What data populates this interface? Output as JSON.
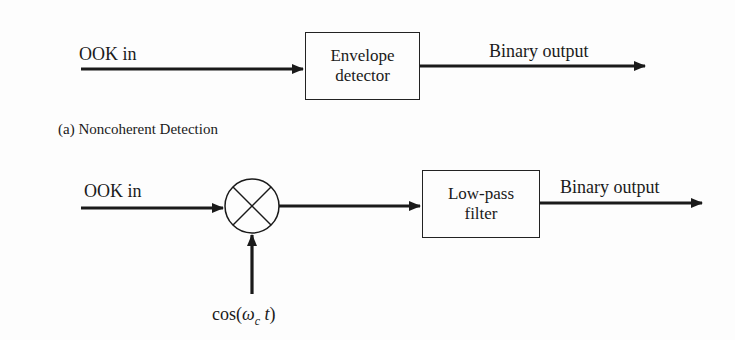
{
  "diagram_a": {
    "input_label": "OOK in",
    "block": {
      "line1": "Envelope",
      "line2": "detector"
    },
    "output_label": "Binary output",
    "caption": "(a) Noncoherent Detection"
  },
  "diagram_b": {
    "input_label": "OOK in",
    "mixer_symbol": "multiplier",
    "oscillator_label": {
      "func": "cos(",
      "omega": "ω",
      "sub": "c",
      "t": "t",
      "close": ")"
    },
    "block": {
      "line1": "Low-pass",
      "line2": "filter"
    },
    "output_label": "Binary output"
  },
  "colors": {
    "stroke": "#1a1a1a",
    "background": "#fdfdfd"
  }
}
